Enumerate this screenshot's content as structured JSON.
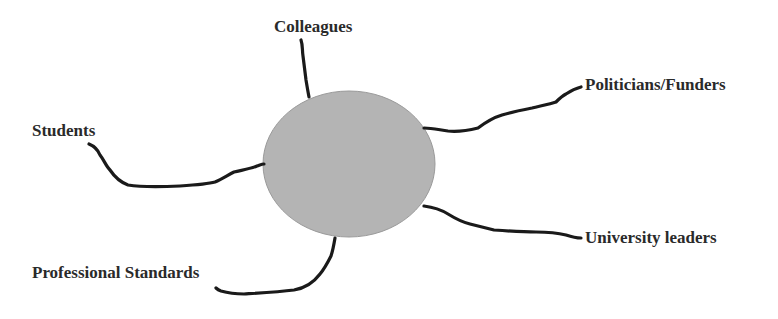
{
  "diagram": {
    "type": "hub-and-spoke",
    "center": {
      "label": "",
      "shape": "ellipse",
      "fill": "#b4b4b4",
      "stroke": "#9a9a9a"
    },
    "connector_color": "#1a1a1a",
    "nodes": [
      {
        "id": "colleagues",
        "label": "Colleagues"
      },
      {
        "id": "politicians-funders",
        "label": "Politicians/Funders"
      },
      {
        "id": "students",
        "label": "Students"
      },
      {
        "id": "university-leaders",
        "label": "University leaders"
      },
      {
        "id": "professional-standards",
        "label": "Professional Standards"
      }
    ]
  }
}
